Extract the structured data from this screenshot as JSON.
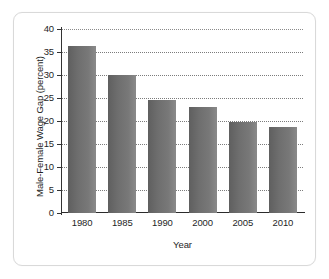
{
  "chart_data": {
    "type": "bar",
    "title": "",
    "xlabel": "Year",
    "ylabel": "Male-Female Wage Gap (percent)",
    "categories": [
      "1980",
      "1985",
      "1990",
      "2000",
      "2005",
      "2010"
    ],
    "values": [
      36.4,
      29.9,
      24.5,
      23.0,
      19.7,
      18.8
    ],
    "ylim": [
      0,
      40
    ],
    "ytick_labels": [
      "0",
      "5",
      "10",
      "15",
      "20",
      "25",
      "30",
      "35",
      "40"
    ],
    "ytick_values": [
      0,
      5,
      10,
      15,
      20,
      25,
      30,
      35,
      40
    ],
    "grid": "horizontal-dotted",
    "legend": "none",
    "series": [
      {
        "name": "Male-Female Wage Gap (percent)",
        "values": [
          36.4,
          29.9,
          24.5,
          23.0,
          19.7,
          18.8
        ]
      }
    ]
  },
  "style": {
    "bar_color": "#6e6e6e",
    "axis_color": "#2b2b2b",
    "grid_color": "#7c7c7c",
    "panel_background": "#ffffff",
    "panel_border": "#d9d9d9",
    "text_color": "#1f1f1f"
  }
}
